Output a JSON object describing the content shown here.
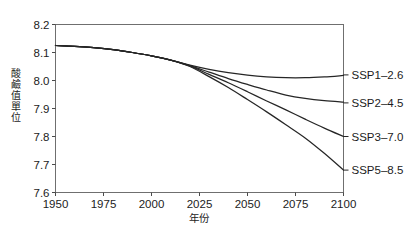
{
  "chart_data": {
    "type": "line",
    "title": "",
    "xlabel": "年份",
    "ylabel": "酸鹼值單位",
    "xlim": [
      1950,
      2100
    ],
    "ylim": [
      7.6,
      8.2
    ],
    "grid": false,
    "legend_position": "right-inline",
    "xticks": [
      1950,
      1975,
      2000,
      2025,
      2050,
      2075,
      2100
    ],
    "xtick_labels": [
      "1950",
      "1975",
      "2000",
      "2025",
      "2050",
      "2075",
      "2100"
    ],
    "yticks": [
      7.6,
      7.7,
      7.8,
      7.9,
      8.0,
      8.1,
      8.2
    ],
    "ytick_labels": [
      "7.6",
      "7.7",
      "7.8",
      "7.9",
      "8.0",
      "8.1",
      "8.2"
    ],
    "x": [
      1950,
      1960,
      1970,
      1980,
      1990,
      2000,
      2010,
      2020,
      2030,
      2040,
      2050,
      2060,
      2070,
      2080,
      2090,
      2100
    ],
    "series": [
      {
        "name": "SSP1-2.6",
        "label": "SSP1–2.6",
        "color": "#262626",
        "end_value": 8.02,
        "values": [
          8.125,
          8.122,
          8.117,
          8.11,
          8.1,
          8.088,
          8.073,
          8.055,
          8.04,
          8.028,
          8.019,
          8.013,
          8.01,
          8.01,
          8.013,
          8.018
        ]
      },
      {
        "name": "SSP2-4.5",
        "label": "SSP2–4.5",
        "color": "#262626",
        "end_value": 7.92,
        "values": [
          8.125,
          8.122,
          8.117,
          8.11,
          8.1,
          8.088,
          8.073,
          8.053,
          8.03,
          8.007,
          7.986,
          7.966,
          7.948,
          7.936,
          7.928,
          7.923
        ]
      },
      {
        "name": "SSP3-7.0",
        "label": "SSP3–7.0",
        "color": "#262626",
        "end_value": 7.8,
        "values": [
          8.125,
          8.122,
          8.117,
          8.11,
          8.1,
          8.088,
          8.073,
          8.052,
          8.022,
          7.992,
          7.96,
          7.927,
          7.895,
          7.862,
          7.83,
          7.8
        ]
      },
      {
        "name": "SSP5-8.5",
        "label": "SSP5–8.5",
        "color": "#262626",
        "end_value": 7.68,
        "values": [
          8.125,
          8.122,
          8.117,
          8.11,
          8.1,
          8.088,
          8.073,
          8.05,
          8.014,
          7.975,
          7.932,
          7.888,
          7.842,
          7.795,
          7.74,
          7.68
        ]
      }
    ]
  },
  "axis": {
    "y_label_chars": [
      "酸",
      "鹼",
      "值",
      "單",
      "位"
    ],
    "x_label": "年份"
  },
  "frame": {
    "color": "#6f6f6f"
  }
}
